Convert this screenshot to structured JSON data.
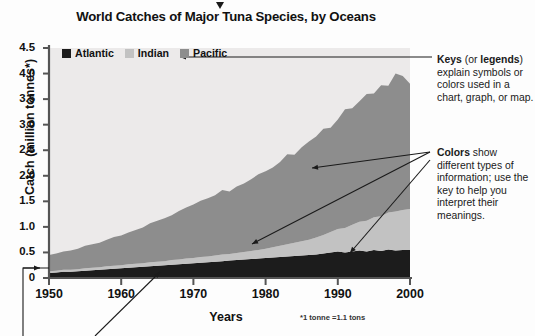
{
  "chart_data": {
    "type": "area",
    "stacked": true,
    "title": "World Catches of Major Tuna Species, by Oceans",
    "xlabel": "Years",
    "ylabel": "Catch (million tonnes*)",
    "footnote": "*1 tonne =1.1 tons",
    "xlim": [
      1950,
      2000
    ],
    "ylim": [
      0,
      4.5
    ],
    "xticks": [
      1950,
      1960,
      1970,
      1980,
      1990,
      2000
    ],
    "yticks": [
      0,
      0.5,
      1.0,
      1.5,
      2.0,
      2.5,
      3.0,
      3.5,
      4.0,
      4.5
    ],
    "ytick_labels": [
      "0",
      "0.5",
      "1.0",
      "1.5",
      "2.0",
      "2.5",
      "3.0",
      "3.5",
      "4.0",
      "4.5"
    ],
    "xtick_labels": [
      "1950",
      "1960",
      "1970",
      "1980",
      "1990",
      "2000"
    ],
    "grid": false,
    "legend_position": "top-left",
    "x": [
      1950,
      1951,
      1952,
      1953,
      1954,
      1955,
      1956,
      1957,
      1958,
      1959,
      1960,
      1961,
      1962,
      1963,
      1964,
      1965,
      1966,
      1967,
      1968,
      1969,
      1970,
      1971,
      1972,
      1973,
      1974,
      1975,
      1976,
      1977,
      1978,
      1979,
      1980,
      1981,
      1982,
      1983,
      1984,
      1985,
      1986,
      1987,
      1988,
      1989,
      1990,
      1991,
      1992,
      1993,
      1994,
      1995,
      1996,
      1997,
      1998,
      1999,
      2000
    ],
    "series": [
      {
        "name": "Atlantic",
        "color": "#1c1c1c",
        "values": [
          0.1,
          0.11,
          0.12,
          0.12,
          0.13,
          0.14,
          0.15,
          0.16,
          0.17,
          0.18,
          0.19,
          0.2,
          0.21,
          0.22,
          0.23,
          0.24,
          0.25,
          0.26,
          0.27,
          0.28,
          0.29,
          0.3,
          0.31,
          0.32,
          0.33,
          0.34,
          0.35,
          0.36,
          0.37,
          0.38,
          0.39,
          0.4,
          0.41,
          0.42,
          0.43,
          0.44,
          0.45,
          0.46,
          0.48,
          0.5,
          0.52,
          0.5,
          0.52,
          0.54,
          0.52,
          0.55,
          0.53,
          0.56,
          0.54,
          0.55,
          0.55
        ]
      },
      {
        "name": "Indian",
        "color": "#c2c2c2",
        "values": [
          0.03,
          0.03,
          0.04,
          0.04,
          0.04,
          0.05,
          0.05,
          0.05,
          0.06,
          0.06,
          0.06,
          0.07,
          0.07,
          0.07,
          0.08,
          0.08,
          0.08,
          0.09,
          0.09,
          0.1,
          0.1,
          0.11,
          0.11,
          0.12,
          0.13,
          0.13,
          0.14,
          0.15,
          0.16,
          0.17,
          0.18,
          0.2,
          0.22,
          0.24,
          0.26,
          0.28,
          0.3,
          0.33,
          0.36,
          0.4,
          0.44,
          0.48,
          0.52,
          0.56,
          0.6,
          0.64,
          0.68,
          0.72,
          0.76,
          0.78,
          0.8
        ]
      },
      {
        "name": "Pacific",
        "color": "#8d8d8d",
        "values": [
          0.32,
          0.34,
          0.36,
          0.38,
          0.4,
          0.44,
          0.46,
          0.48,
          0.52,
          0.56,
          0.58,
          0.62,
          0.66,
          0.7,
          0.76,
          0.8,
          0.84,
          0.88,
          0.95,
          1.0,
          1.05,
          1.1,
          1.14,
          1.18,
          1.26,
          1.22,
          1.3,
          1.34,
          1.4,
          1.48,
          1.52,
          1.56,
          1.64,
          1.76,
          1.72,
          1.84,
          1.92,
          1.98,
          2.08,
          2.04,
          2.14,
          2.32,
          2.28,
          2.36,
          2.48,
          2.42,
          2.56,
          2.48,
          2.7,
          2.62,
          2.45
        ]
      }
    ]
  },
  "legend": {
    "items": [
      {
        "label": "Atlantic",
        "color": "#1c1c1c"
      },
      {
        "label": "Indian",
        "color": "#c2c2c2"
      },
      {
        "label": "Pacific",
        "color": "#8d8d8d"
      }
    ]
  },
  "annotations": {
    "keys": {
      "bold1": "Keys",
      "mid1": " (or ",
      "bold2": "legends",
      "rest": ") explain symbols or colors used in a chart, graph, or map."
    },
    "colors": {
      "bold1": "Colors",
      "rest": " show different types of information; use the key to help you interpret their meanings."
    }
  },
  "colors": {
    "plot_background": "#eceaea",
    "axis": "#555555",
    "text": "#111111",
    "annotation_line": "#1a1a1a"
  }
}
